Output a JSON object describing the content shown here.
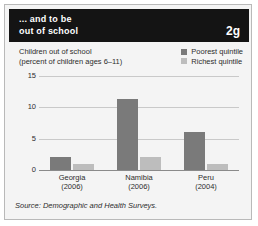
{
  "header": {
    "title": "... and to be\nout of school",
    "badge": "2g",
    "bg_color": "#141414",
    "text_color": "#ffffff"
  },
  "chart_title": "Children out of school\n(percent of children ages 6–11)",
  "legend": {
    "items": [
      {
        "label": "Poorest quintile",
        "color": "#7a7a7a"
      },
      {
        "label": "Richest quintile",
        "color": "#bdbdbd"
      }
    ]
  },
  "source": "Source: Demographic and Health Surveys.",
  "chart_data": {
    "type": "bar",
    "title": "Children out of school",
    "subtitle": "(percent of children ages 6–11)",
    "xlabel": "",
    "ylabel": "",
    "categories": [
      "Georgia\n(2006)",
      "Namibia\n(2006)",
      "Peru\n(2004)"
    ],
    "category_names": [
      "Georgia",
      "Namibia",
      "Peru"
    ],
    "category_years": [
      "(2006)",
      "(2006)",
      "(2004)"
    ],
    "series": [
      {
        "name": "Poorest quintile",
        "color": "#7a7a7a",
        "values": [
          2,
          11.3,
          6
        ]
      },
      {
        "name": "Richest quintile",
        "color": "#bdbdbd",
        "values": [
          1,
          2,
          1
        ]
      }
    ],
    "ylim": [
      0,
      15
    ],
    "yticks": [
      0,
      5,
      10,
      15
    ],
    "ytick_labels": [
      "0",
      "5",
      "10",
      "15"
    ],
    "grid": true,
    "legend_position": "top-right"
  }
}
